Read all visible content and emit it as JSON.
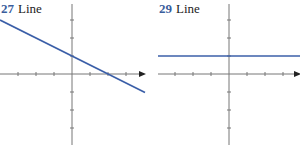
{
  "colors": {
    "line": "#3b5fa8",
    "axis": "#777777",
    "number": "#3a5d9c"
  },
  "chart_data": [
    {
      "type": "line",
      "number": "27",
      "title": "Line",
      "equation_slope": -0.5,
      "equation_intercept": 1,
      "xlim": [
        -4,
        4
      ],
      "ylim": [
        -4,
        4
      ],
      "x_ticks": [
        -3,
        -2,
        -1,
        1,
        2,
        3
      ],
      "y_ticks": [
        -3,
        -2,
        -1,
        1,
        2,
        3
      ],
      "series": [
        {
          "name": "line",
          "x": [
            -4,
            4
          ],
          "y": [
            3,
            -1
          ]
        }
      ],
      "grid": false
    },
    {
      "type": "line",
      "number": "29",
      "title": "Line",
      "equation_slope": 0,
      "equation_intercept": 1,
      "xlim": [
        -4,
        4
      ],
      "ylim": [
        -4,
        4
      ],
      "x_ticks": [
        -3,
        -2,
        -1,
        1,
        2,
        3
      ],
      "y_ticks": [
        -3,
        -2,
        -1,
        1,
        2,
        3
      ],
      "series": [
        {
          "name": "line",
          "x": [
            -4,
            4
          ],
          "y": [
            1,
            1
          ]
        }
      ],
      "grid": false
    }
  ]
}
